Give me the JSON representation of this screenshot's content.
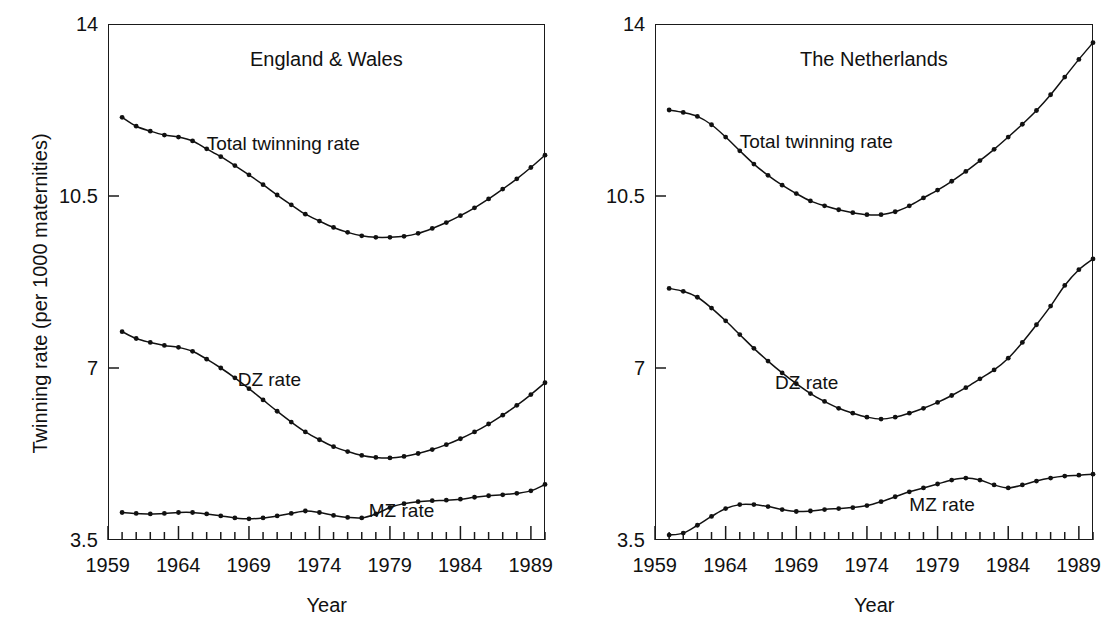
{
  "figure": {
    "ylabel": "Twinning rate (per 1000 maternities)",
    "xlabel_left": "Year",
    "xlabel_right": "Year"
  },
  "chart_data": [
    {
      "type": "line",
      "title": "England & Wales",
      "xlabel": "Year",
      "ylabel": "Twinning rate (per 1000 maternities)",
      "xlim": [
        1959,
        1990
      ],
      "ylim": [
        3.5,
        14
      ],
      "yticks": [
        3.5,
        7,
        10.5,
        14
      ],
      "ytick_labels": [
        "3.5",
        "7",
        "10.5",
        "14"
      ],
      "xticks": [
        1959,
        1964,
        1969,
        1974,
        1979,
        1984,
        1989
      ],
      "xtick_labels": [
        "1959",
        "1964",
        "1969",
        "1974",
        "1979",
        "1984",
        "1989"
      ],
      "minor_xtick_interval": 1,
      "grid": false,
      "legend": "inline-annotations",
      "x": [
        1960,
        1961,
        1962,
        1963,
        1964,
        1965,
        1966,
        1967,
        1968,
        1969,
        1970,
        1971,
        1972,
        1973,
        1974,
        1975,
        1976,
        1977,
        1978,
        1979,
        1980,
        1981,
        1982,
        1983,
        1984,
        1985,
        1986,
        1987,
        1988,
        1989,
        1990
      ],
      "series": [
        {
          "name": "Total twinning rate",
          "label_x": 1966.0,
          "label_y": 11.55,
          "values": [
            12.1,
            11.92,
            11.82,
            11.74,
            11.7,
            11.62,
            11.46,
            11.3,
            11.12,
            10.93,
            10.73,
            10.52,
            10.32,
            10.13,
            9.99,
            9.86,
            9.76,
            9.69,
            9.66,
            9.66,
            9.68,
            9.74,
            9.84,
            9.96,
            10.1,
            10.26,
            10.44,
            10.64,
            10.85,
            11.08,
            11.33
          ]
        },
        {
          "name": "DZ rate",
          "label_x": 1968.2,
          "label_y": 6.75,
          "values": [
            7.74,
            7.6,
            7.52,
            7.46,
            7.42,
            7.34,
            7.18,
            7.0,
            6.8,
            6.58,
            6.35,
            6.12,
            5.9,
            5.7,
            5.54,
            5.4,
            5.3,
            5.22,
            5.18,
            5.17,
            5.2,
            5.26,
            5.34,
            5.44,
            5.56,
            5.7,
            5.86,
            6.04,
            6.24,
            6.46,
            6.7
          ]
        },
        {
          "name": "MZ rate",
          "label_x": 1977.5,
          "label_y": 4.08,
          "values": [
            4.06,
            4.04,
            4.03,
            4.04,
            4.06,
            4.06,
            4.03,
            3.99,
            3.95,
            3.93,
            3.95,
            3.99,
            4.04,
            4.09,
            4.06,
            4.0,
            3.96,
            3.95,
            4.03,
            4.16,
            4.24,
            4.28,
            4.3,
            4.31,
            4.33,
            4.37,
            4.4,
            4.42,
            4.45,
            4.5,
            4.63
          ]
        }
      ]
    },
    {
      "type": "line",
      "title": "The Netherlands",
      "xlabel": "Year",
      "ylabel": "Twinning rate (per 1000 maternities)",
      "xlim": [
        1959,
        1990
      ],
      "ylim": [
        3.5,
        14
      ],
      "yticks": [
        3.5,
        7,
        10.5,
        14
      ],
      "ytick_labels": [
        "3.5",
        "7",
        "10.5",
        "14"
      ],
      "xticks": [
        1959,
        1964,
        1969,
        1974,
        1979,
        1984,
        1989
      ],
      "xtick_labels": [
        "1959",
        "1964",
        "1969",
        "1974",
        "1979",
        "1984",
        "1989"
      ],
      "minor_xtick_interval": 1,
      "grid": false,
      "legend": "inline-annotations",
      "x": [
        1960,
        1961,
        1962,
        1963,
        1964,
        1965,
        1966,
        1967,
        1968,
        1969,
        1970,
        1971,
        1972,
        1973,
        1974,
        1975,
        1976,
        1977,
        1978,
        1979,
        1980,
        1981,
        1982,
        1983,
        1984,
        1985,
        1986,
        1987,
        1988,
        1989,
        1990
      ],
      "series": [
        {
          "name": "Total twinning rate",
          "label_x": 1965.0,
          "label_y": 11.6,
          "values": [
            12.25,
            12.2,
            12.12,
            11.95,
            11.7,
            11.42,
            11.15,
            10.92,
            10.72,
            10.55,
            10.4,
            10.3,
            10.22,
            10.16,
            10.12,
            10.12,
            10.18,
            10.3,
            10.46,
            10.62,
            10.8,
            11.0,
            11.22,
            11.45,
            11.7,
            11.96,
            12.24,
            12.56,
            12.92,
            13.28,
            13.62
          ]
        },
        {
          "name": "DZ rate",
          "label_x": 1967.5,
          "label_y": 6.7,
          "values": [
            8.62,
            8.56,
            8.44,
            8.22,
            7.96,
            7.68,
            7.4,
            7.14,
            6.9,
            6.68,
            6.48,
            6.32,
            6.18,
            6.08,
            6.0,
            5.96,
            6.0,
            6.08,
            6.18,
            6.3,
            6.44,
            6.6,
            6.78,
            6.96,
            7.2,
            7.52,
            7.88,
            8.26,
            8.68,
            9.0,
            9.22
          ]
        },
        {
          "name": "MZ rate",
          "label_x": 1977.0,
          "label_y": 4.22,
          "values": [
            3.6,
            3.64,
            3.8,
            3.98,
            4.14,
            4.22,
            4.22,
            4.18,
            4.12,
            4.08,
            4.09,
            4.12,
            4.14,
            4.16,
            4.2,
            4.28,
            4.38,
            4.48,
            4.56,
            4.64,
            4.72,
            4.76,
            4.72,
            4.62,
            4.56,
            4.62,
            4.7,
            4.76,
            4.8,
            4.82,
            4.84
          ]
        }
      ]
    }
  ],
  "colors": {
    "ink": "#111111",
    "frame": "#1a1a1a",
    "background": "#ffffff"
  }
}
